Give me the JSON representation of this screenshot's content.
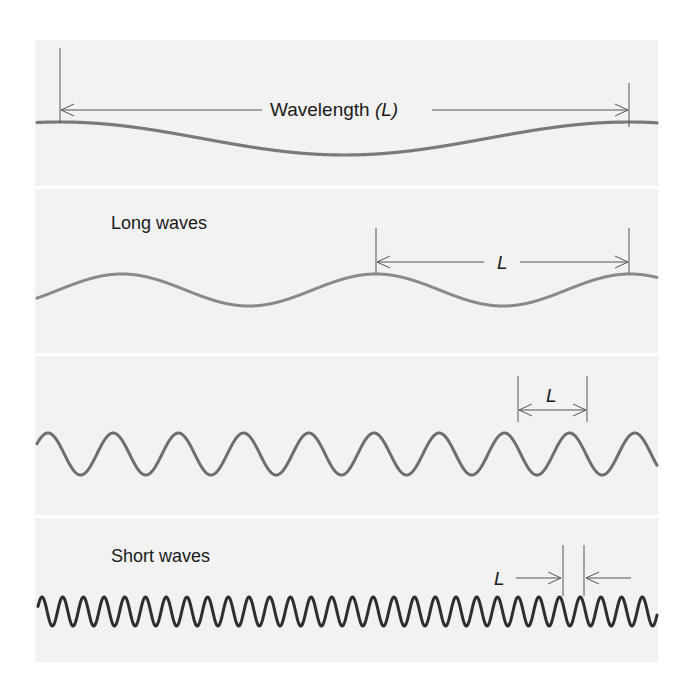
{
  "figure": {
    "panels": [
      {
        "id": "reference",
        "label": "",
        "wave": {
          "period_px": 569,
          "amplitude_px": 16.5,
          "color": "#7a7a7a",
          "stroke_width": 3.2
        },
        "dimension": {
          "text_main": "Wavelength ",
          "text_italic": "(L)"
        }
      },
      {
        "id": "long",
        "label": "Long waves",
        "wave": {
          "period_px": 254,
          "amplitude_px": 16,
          "color": "#8a8a8a",
          "stroke_width": 3
        },
        "dimension": {
          "text_italic": "L"
        }
      },
      {
        "id": "medium",
        "label": "",
        "wave": {
          "period_px": 65.2,
          "amplitude_px": 21,
          "color": "#6e6e6e",
          "stroke_width": 3
        },
        "dimension": {
          "text_italic": "L"
        }
      },
      {
        "id": "short",
        "label": "Short waves",
        "wave": {
          "period_px": 20.7,
          "amplitude_px": 14.5,
          "color": "#2e2e2e",
          "stroke_width": 3
        },
        "dimension": {
          "text_italic": "L"
        }
      }
    ],
    "colors": {
      "panel_background": "#f2f2f2",
      "separator": "#ffffff",
      "dimension_line": "#555555",
      "text": "#1a1a1a"
    }
  }
}
